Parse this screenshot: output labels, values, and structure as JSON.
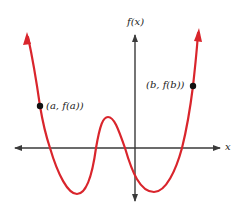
{
  "diagram": {
    "type": "function-graph",
    "axes": {
      "x_label": "x",
      "y_label": "f(x)",
      "color": "#3a3a3a"
    },
    "curve": {
      "color": "#d9252c",
      "description": "polynomial with two local minima and one local maximum between",
      "path": "M28,37 C33,60 37,85 40,106 C44,130 48,142 50,148 C58,175 68,194 77,194 C88,194 93,170 96,148 C100,125 103,117 108,117 C114,117 118,128 125,148 C132,172 140,192 154,192 C166,192 176,170 182,148 C186,132 190,110 193,86 C195,68 197,50 198,33"
    },
    "points": [
      {
        "id": "a",
        "label": "(a, f(a))",
        "x": 40,
        "y": 106
      },
      {
        "id": "b",
        "label": "(b, f(b))",
        "x": 193,
        "y": 86
      }
    ]
  }
}
